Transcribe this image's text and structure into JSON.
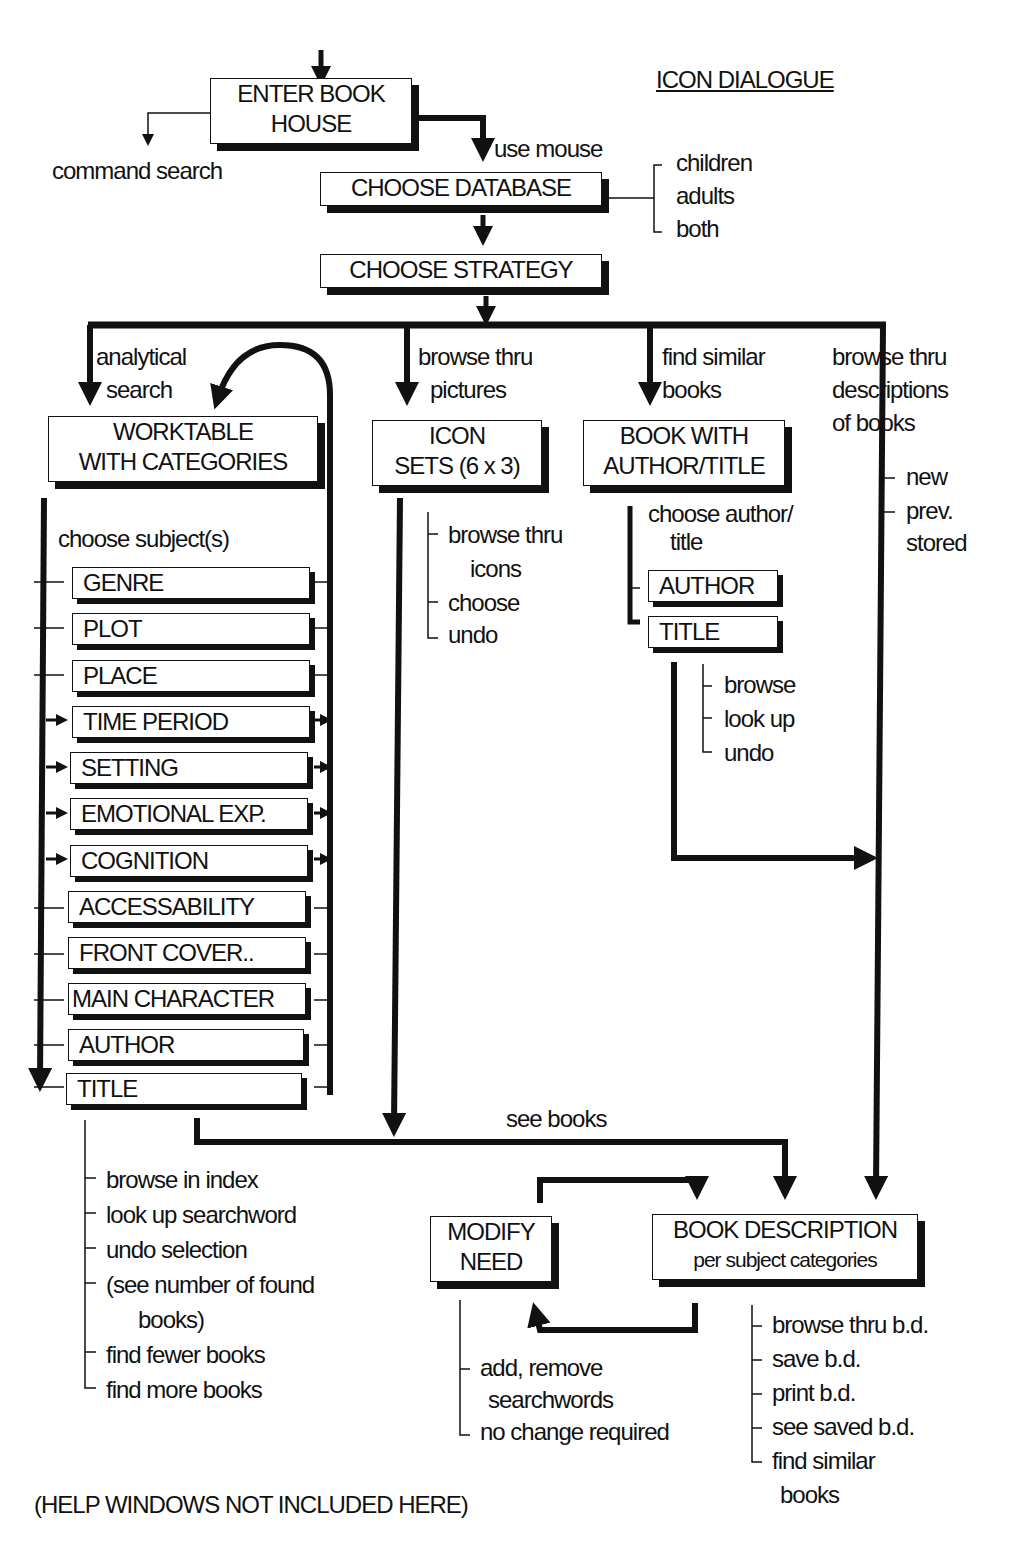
{
  "page_marker": "115",
  "heading": "ICON DIALOGUE",
  "boxes": {
    "enter_book_house": [
      "ENTER BOOK",
      "HOUSE"
    ],
    "choose_database": "CHOOSE DATABASE",
    "choose_strategy": "CHOOSE STRATEGY",
    "worktable": [
      "WORKTABLE",
      "WITH CATEGORIES"
    ],
    "icon_sets": [
      "ICON",
      "SETS (6 x 3)"
    ],
    "book_author_title": [
      "BOOK WITH",
      "AUTHOR/TITLE"
    ],
    "author": "AUTHOR",
    "title": "TITLE",
    "modify_need": [
      "MODIFY",
      "NEED"
    ],
    "book_description": [
      "BOOK DESCRIPTION",
      "per subject categories"
    ]
  },
  "labels": {
    "command_search": "command search",
    "use_mouse": "use mouse",
    "analytical_search": [
      "analytical",
      "search"
    ],
    "browse_pictures": [
      "browse thru",
      "pictures"
    ],
    "find_similar": [
      "find similar",
      "books"
    ],
    "browse_descriptions": [
      "browse thru",
      "descriptions",
      "of books"
    ],
    "choose_subjects": "choose subject(s)",
    "choose_author_title": [
      "choose author/",
      "title"
    ],
    "see_books": "see books",
    "footer_note": "(HELP WINDOWS NOT INCLUDED HERE)"
  },
  "database_options": [
    "children",
    "adults",
    "both"
  ],
  "description_sources": [
    "new",
    "prev.",
    "stored"
  ],
  "categories": [
    "GENRE",
    "PLOT",
    "PLACE",
    "TIME PERIOD",
    "SETTING",
    "EMOTIONAL EXP.",
    "COGNITION",
    "ACCESSABILITY",
    "FRONT COVER..",
    "MAIN CHARACTER",
    "AUTHOR",
    "TITLE"
  ],
  "icon_actions": [
    "browse thru",
    "icons",
    "choose",
    "undo"
  ],
  "title_actions": [
    "browse",
    "look up",
    "undo"
  ],
  "worktable_actions": [
    "browse in index",
    "look up searchword",
    "undo selection",
    "(see number of found",
    "books)",
    "find fewer books",
    "find more books"
  ],
  "modify_actions": [
    "add, remove",
    "searchwords",
    "no change required"
  ],
  "description_actions": [
    "browse thru b.d.",
    "save b.d.",
    "print b.d.",
    "see saved b.d.",
    "find similar",
    "books"
  ]
}
